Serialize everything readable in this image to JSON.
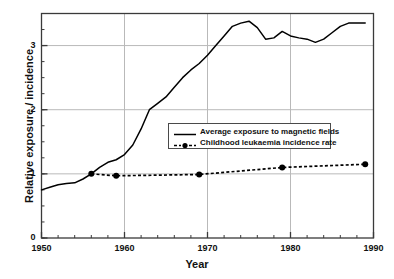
{
  "chart_data": {
    "type": "line",
    "title": "",
    "xlabel": "Year",
    "ylabel": "Relative exposure / incidence",
    "xlim": [
      1950,
      1990
    ],
    "ylim": [
      0,
      3.5
    ],
    "xticks": [
      1950,
      1960,
      1970,
      1980,
      1990
    ],
    "xtick_labels": [
      "1950",
      "1960",
      "1970",
      "1980",
      "1990"
    ],
    "yticks": [
      0,
      1,
      2,
      3
    ],
    "ytick_labels": [
      "0",
      "1",
      "2",
      "3"
    ],
    "x_minor_tick_step": 2,
    "y_minor_tick_step": 0.25,
    "grid": "horizontal-and-vertical-at-major-ticks",
    "legend_position": "center",
    "series": [
      {
        "name": "Average exposure to magnetic fields",
        "style": "solid-line",
        "marker": "none",
        "color": "#000000",
        "x": [
          1950,
          1951,
          1952,
          1953,
          1954,
          1955,
          1956,
          1957,
          1958,
          1959,
          1960,
          1961,
          1962,
          1963,
          1964,
          1965,
          1966,
          1967,
          1968,
          1969,
          1970,
          1971,
          1972,
          1973,
          1974,
          1975,
          1976,
          1977,
          1978,
          1979,
          1980,
          1981,
          1982,
          1983,
          1984,
          1985,
          1986,
          1987,
          1988,
          1989
        ],
        "values": [
          0.75,
          0.79,
          0.83,
          0.85,
          0.86,
          0.92,
          1.0,
          1.1,
          1.18,
          1.22,
          1.3,
          1.45,
          1.7,
          2.0,
          2.1,
          2.2,
          2.35,
          2.5,
          2.62,
          2.72,
          2.85,
          3.0,
          3.15,
          3.3,
          3.35,
          3.38,
          3.28,
          3.1,
          3.12,
          3.22,
          3.15,
          3.12,
          3.1,
          3.05,
          3.1,
          3.2,
          3.3,
          3.35,
          3.35,
          3.35
        ]
      },
      {
        "name": "Childhood leukaemia incidence rate",
        "style": "dashed-line",
        "marker": "filled-circle",
        "color": "#000000",
        "x": [
          1956,
          1959,
          1969,
          1979,
          1989
        ],
        "values": [
          1.0,
          0.97,
          0.99,
          1.1,
          1.15
        ]
      }
    ]
  },
  "legend": {
    "items": [
      {
        "label": "Average exposure to magnetic fields",
        "key": "solid-line-key"
      },
      {
        "label": "Childhood leukaemia incidence rate",
        "key": "dashed-marker-key"
      }
    ]
  },
  "colors": {
    "line": "#000000",
    "grid": "#b9b9b9",
    "frame": "#3a3a3a",
    "text": "#111111",
    "background": "#ffffff"
  }
}
